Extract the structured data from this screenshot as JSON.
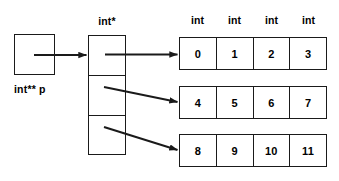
{
  "diagram": {
    "root_pointer": {
      "label": "int** p",
      "name": "root-pointer-box"
    },
    "pointer_array": {
      "type_label": "int*",
      "cells": [
        {
          "name": "pointer-cell-0"
        },
        {
          "name": "pointer-cell-1"
        },
        {
          "name": "pointer-cell-2"
        }
      ]
    },
    "value_table": {
      "headers": [
        "int",
        "int",
        "int",
        "int"
      ],
      "rows": [
        {
          "values": [
            "0",
            "1",
            "2",
            "3"
          ]
        },
        {
          "values": [
            "4",
            "5",
            "6",
            "7"
          ]
        },
        {
          "values": [
            "8",
            "9",
            "10",
            "11"
          ]
        }
      ]
    },
    "arrows": [
      {
        "name": "arrow-root-to-pointer-array"
      },
      {
        "name": "arrow-pointer-0-to-row-0"
      },
      {
        "name": "arrow-pointer-1-to-row-1"
      },
      {
        "name": "arrow-pointer-2-to-row-2"
      }
    ],
    "colors": {
      "stroke": "#1a1a1a",
      "background": "#ffffff",
      "text": "#000000"
    }
  }
}
